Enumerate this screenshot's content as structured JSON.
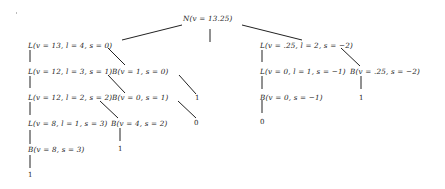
{
  "diagram": {
    "type": "tree",
    "root": "N(v = 13.25)",
    "nodes": {
      "root": "N(v = 13.25)",
      "l1": "L(v = 13, l = 4, s = 0)",
      "l2": "L(v = 12, l = 3, s = 1)",
      "b1": "B(v = 1, s = 0)",
      "l3": "L(v = 12, l = 2, s = 2)",
      "b2": "B(v = 0, s = 1)",
      "l4": "L(v = 8, l = 1, s = 3)",
      "b3": "B(v = 4, s = 2)",
      "b4": "B(v = 8, s = 3)",
      "r1": "L(v = .25, l = 2, s = −2)",
      "r2": "L(v = 0, l = 1, s = −1)",
      "rb1": "B(v = .25, s = −2)",
      "rb2": "B(v = 0, s = −1)"
    },
    "leaves": {
      "b1_leaf": "1",
      "b2_leaf": "0",
      "b3_leaf": "1",
      "b4_leaf": "1",
      "rb1_leaf": "1",
      "rb2_leaf": "0"
    },
    "line_color": "#222222"
  }
}
